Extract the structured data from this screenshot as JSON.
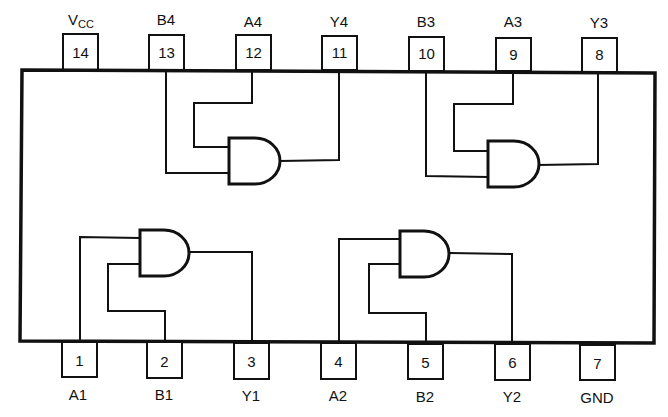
{
  "diagram": {
    "type": "IC pinout / logic diagram",
    "top_pins": [
      {
        "number": "14",
        "label": "VCC",
        "label_main": "V",
        "label_sub": "CC"
      },
      {
        "number": "13",
        "label": "B4"
      },
      {
        "number": "12",
        "label": "A4"
      },
      {
        "number": "11",
        "label": "Y4"
      },
      {
        "number": "10",
        "label": "B3"
      },
      {
        "number": "9",
        "label": "A3"
      },
      {
        "number": "8",
        "label": "Y3"
      }
    ],
    "bottom_pins": [
      {
        "number": "1",
        "label": "A1"
      },
      {
        "number": "2",
        "label": "B1"
      },
      {
        "number": "3",
        "label": "Y1"
      },
      {
        "number": "4",
        "label": "A2"
      },
      {
        "number": "5",
        "label": "B2"
      },
      {
        "number": "6",
        "label": "Y2"
      },
      {
        "number": "7",
        "label": "GND"
      }
    ],
    "gates": [
      {
        "name": "gate-1",
        "type": "AND",
        "inputs": [
          "A1 (1)",
          "B1 (2)"
        ],
        "output": "Y1 (3)"
      },
      {
        "name": "gate-2",
        "type": "AND",
        "inputs": [
          "A2 (4)",
          "B2 (5)"
        ],
        "output": "Y2 (6)"
      },
      {
        "name": "gate-3",
        "type": "AND",
        "inputs": [
          "A3 (9)",
          "B3 (10)"
        ],
        "output": "Y3 (8)"
      },
      {
        "name": "gate-4",
        "type": "AND",
        "inputs": [
          "A4 (12)",
          "B4 (13)"
        ],
        "output": "Y4 (11)"
      }
    ],
    "colors": {
      "line": "#111111",
      "background": "#ffffff"
    }
  }
}
